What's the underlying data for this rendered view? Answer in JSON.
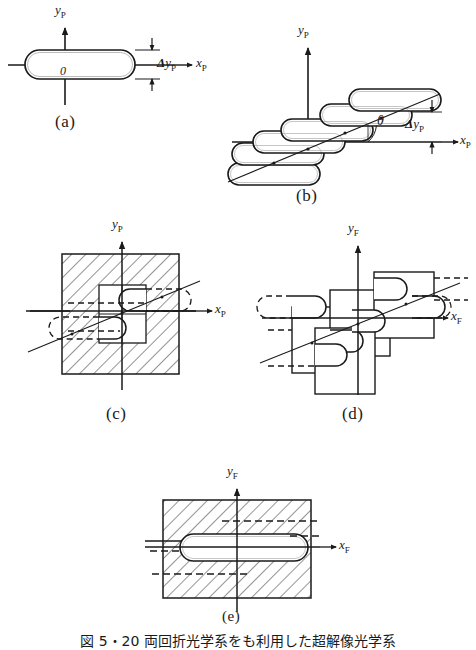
{
  "figure": {
    "caption": "図 5・20  両回折光学系をも利用した超解像光学系",
    "panels": [
      {
        "id": "a",
        "label": "(a)",
        "axis_x": "x",
        "axis_x_sub": "P",
        "axis_y": "y",
        "axis_y_sub": "P",
        "origin_label": "0",
        "dimension_label": "Δy",
        "dimension_sub": "P",
        "description": "single stadium aperture centered at origin"
      },
      {
        "id": "b",
        "label": "(b)",
        "axis_x": "x",
        "axis_x_sub": "P",
        "axis_y": "y",
        "axis_y_sub": "P",
        "angle_label": "θ",
        "dimension_label": "Δy",
        "dimension_sub": "P",
        "description": "staggered stadium apertures along inclined line"
      },
      {
        "id": "c",
        "label": "(c)",
        "axis_x": "x",
        "axis_x_sub": "P",
        "axis_y": "y",
        "axis_y_sub": "P",
        "description": "hatched square mask with inner window and dashed apertures"
      },
      {
        "id": "d",
        "label": "(d)",
        "axis_x": "x",
        "axis_x_sub": "F",
        "axis_y": "y",
        "axis_y_sub": "F",
        "description": "staggered rectangular cells with stadium apertures"
      },
      {
        "id": "e",
        "label": "(e)",
        "axis_x": "x",
        "axis_x_sub": "F",
        "axis_y": "y",
        "axis_y_sub": "F",
        "description": "hatched rectangle with single clear stadium aperture"
      }
    ]
  },
  "style": {
    "ink": "#1a1a1a",
    "background": "#ffffff",
    "hatch": "#3a3a3a"
  }
}
